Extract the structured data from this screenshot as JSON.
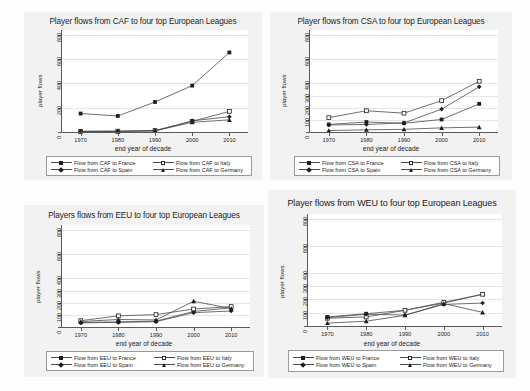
{
  "figure": {
    "background": "#fdfdfd",
    "panel_background": "#f2f2f2",
    "plot_background": "#ffffff",
    "line_color": "#4a4a4a",
    "marker_color": "#1e1e1e"
  },
  "chart_data": [
    {
      "id": "caf",
      "type": "line",
      "title": "Player flows from CAF to four top European Leagues",
      "xlabel": "end year of decade",
      "ylabel": "player flows",
      "categories": [
        1970,
        1980,
        1990,
        2000,
        2010
      ],
      "xticks": [
        "1970",
        "1980",
        "1990",
        "2000",
        "2010"
      ],
      "yticks": [
        0,
        200,
        400,
        600,
        800
      ],
      "ytick_labels": [
        "0",
        "200",
        "400",
        "600",
        "800"
      ],
      "ylim": [
        0,
        840
      ],
      "grid": true,
      "legend_position": "bottom",
      "series": [
        {
          "name": "Flow from CAF to France",
          "marker": "square",
          "values": [
            152,
            132,
            247,
            382,
            655
          ]
        },
        {
          "name": "Flow from CAF to Italy",
          "marker": "square-hollow",
          "values": [
            6,
            7,
            12,
            88,
            170
          ]
        },
        {
          "name": "Flow from CAF to Spain",
          "marker": "diamond",
          "values": [
            5,
            6,
            10,
            92,
            126
          ]
        },
        {
          "name": "Flow from CAF to Germany",
          "marker": "triangle",
          "values": [
            4,
            5,
            9,
            80,
            100
          ]
        }
      ]
    },
    {
      "id": "csa",
      "type": "line",
      "title": "Player flows from CSA to four top European Leagues",
      "xlabel": "end year of decade",
      "ylabel": "player flows",
      "categories": [
        1970,
        1980,
        1990,
        2000,
        2010
      ],
      "xticks": [
        "1970",
        "1980",
        "1990",
        "2000",
        "2010"
      ],
      "yticks": [
        0,
        100,
        200,
        300,
        400,
        600,
        800
      ],
      "ytick_labels": [
        "0",
        "100",
        "200",
        "300",
        "400",
        "600",
        "800"
      ],
      "ylim": [
        0,
        840
      ],
      "grid": true,
      "legend_position": "bottom",
      "series": [
        {
          "name": "Flow from CSA to France",
          "marker": "square",
          "values": [
            62,
            82,
            72,
            103,
            232
          ]
        },
        {
          "name": "Flow from CSA to Italy",
          "marker": "square-hollow",
          "values": [
            118,
            175,
            155,
            258,
            418
          ]
        },
        {
          "name": "Flow from CSA to Spain",
          "marker": "diamond",
          "values": [
            58,
            62,
            75,
            188,
            372
          ]
        },
        {
          "name": "Flow from CSA to Germany",
          "marker": "triangle",
          "values": [
            12,
            18,
            22,
            34,
            40
          ]
        }
      ]
    },
    {
      "id": "eeu",
      "type": "line",
      "title": "Players flows from EEU to four top European Leagues",
      "xlabel": "end year of decade",
      "ylabel": "player flows",
      "categories": [
        1970,
        1980,
        1990,
        2000,
        2010
      ],
      "xticks": [
        "1970",
        "1980",
        "1990",
        "2000",
        "2010"
      ],
      "yticks": [
        0,
        100,
        200,
        300,
        400,
        600,
        800
      ],
      "ytick_labels": [
        "0",
        "100",
        "200",
        "300",
        "400",
        "600",
        "800"
      ],
      "ylim": [
        0,
        840
      ],
      "grid": true,
      "legend_position": "bottom",
      "series": [
        {
          "name": "Flow from EEU to France",
          "marker": "square",
          "values": [
            38,
            42,
            48,
            128,
            158
          ]
        },
        {
          "name": "Flow from EEU to Italy",
          "marker": "square-hollow",
          "values": [
            52,
            92,
            102,
            148,
            168
          ]
        },
        {
          "name": "Flow from EEU to Spain",
          "marker": "diamond",
          "values": [
            34,
            38,
            44,
            118,
            132
          ]
        },
        {
          "name": "Flow from EEU to Germany",
          "marker": "triangle",
          "values": [
            45,
            62,
            58,
            212,
            152
          ]
        }
      ]
    },
    {
      "id": "weu",
      "type": "line",
      "title": "Player flows from WEU to four top European Leagues",
      "xlabel": "end year of decade",
      "ylabel": "player flows",
      "categories": [
        1970,
        1980,
        1990,
        2000,
        2010
      ],
      "xticks": [
        "1970",
        "1980",
        "1990",
        "2000",
        "2010"
      ],
      "yticks": [
        0,
        100,
        200,
        300,
        400,
        600,
        800
      ],
      "ytick_labels": [
        "0",
        "100",
        "200",
        "300",
        "400",
        "600",
        "800"
      ],
      "ylim": [
        0,
        840
      ],
      "grid": true,
      "legend_position": "bottom",
      "series": [
        {
          "name": "Flow from WEU to France",
          "marker": "square",
          "values": [
            68,
            92,
            118,
            172,
            238
          ]
        },
        {
          "name": "Flow from WEU to Italy",
          "marker": "square-hollow",
          "values": [
            58,
            68,
            118,
            178,
            238
          ]
        },
        {
          "name": "Flow from WEU to Spain",
          "marker": "diamond",
          "values": [
            62,
            88,
            82,
            162,
            172
          ]
        },
        {
          "name": "Flow from WEU to Germany",
          "marker": "triangle",
          "values": [
            22,
            36,
            80,
            168,
            102
          ]
        }
      ]
    }
  ]
}
